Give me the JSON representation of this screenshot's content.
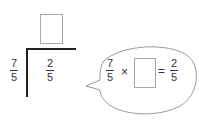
{
  "division": {
    "quotient_box": "",
    "divisor": {
      "numerator": "7",
      "denominator": "5"
    },
    "dividend": {
      "numerator": "2",
      "denominator": "5"
    }
  },
  "bubble": {
    "left": {
      "numerator": "7",
      "denominator": "5"
    },
    "times": "×",
    "answer_box": "",
    "equals": "=",
    "right": {
      "numerator": "2",
      "denominator": "5"
    }
  }
}
